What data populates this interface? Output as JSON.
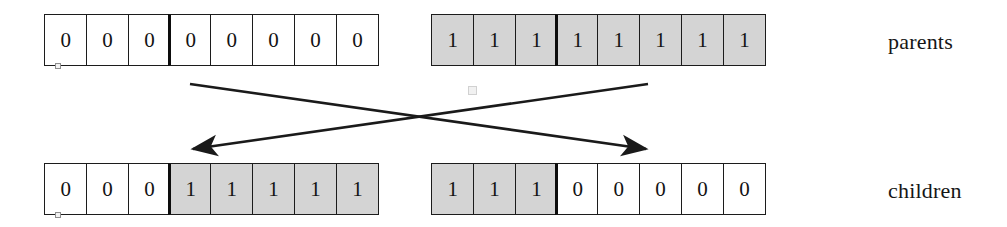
{
  "diagram": {
    "labels": {
      "parents": "parents",
      "children": "children"
    },
    "crossover_point": 3,
    "colors": {
      "shaded_cell": "#d4d4d4",
      "plain_cell": "#ffffff",
      "stroke": "#1c1c1c",
      "text": "#131313"
    },
    "rows": [
      {
        "id": "parent-1",
        "group": "parents",
        "side": "left",
        "cells": [
          {
            "value": "0",
            "shaded": false
          },
          {
            "value": "0",
            "shaded": false
          },
          {
            "value": "0",
            "shaded": false
          },
          {
            "value": "0",
            "shaded": false
          },
          {
            "value": "0",
            "shaded": false
          },
          {
            "value": "0",
            "shaded": false
          },
          {
            "value": "0",
            "shaded": false
          },
          {
            "value": "0",
            "shaded": false
          }
        ]
      },
      {
        "id": "parent-2",
        "group": "parents",
        "side": "right",
        "cells": [
          {
            "value": "1",
            "shaded": true
          },
          {
            "value": "1",
            "shaded": true
          },
          {
            "value": "1",
            "shaded": true
          },
          {
            "value": "1",
            "shaded": true
          },
          {
            "value": "1",
            "shaded": true
          },
          {
            "value": "1",
            "shaded": true
          },
          {
            "value": "1",
            "shaded": true
          },
          {
            "value": "1",
            "shaded": true
          }
        ]
      },
      {
        "id": "child-1",
        "group": "children",
        "side": "left",
        "cells": [
          {
            "value": "0",
            "shaded": false
          },
          {
            "value": "0",
            "shaded": false
          },
          {
            "value": "0",
            "shaded": false
          },
          {
            "value": "1",
            "shaded": true
          },
          {
            "value": "1",
            "shaded": true
          },
          {
            "value": "1",
            "shaded": true
          },
          {
            "value": "1",
            "shaded": true
          },
          {
            "value": "1",
            "shaded": true
          }
        ]
      },
      {
        "id": "child-2",
        "group": "children",
        "side": "right",
        "cells": [
          {
            "value": "1",
            "shaded": true
          },
          {
            "value": "1",
            "shaded": true
          },
          {
            "value": "1",
            "shaded": true
          },
          {
            "value": "0",
            "shaded": false
          },
          {
            "value": "0",
            "shaded": false
          },
          {
            "value": "0",
            "shaded": false
          },
          {
            "value": "0",
            "shaded": false
          },
          {
            "value": "0",
            "shaded": false
          }
        ]
      }
    ],
    "arrows": [
      {
        "id": "arrow-right-parent-to-left-child",
        "from": [
          648,
          84
        ],
        "to": [
          193,
          149
        ]
      },
      {
        "id": "arrow-left-parent-to-right-child",
        "from": [
          190,
          84
        ],
        "to": [
          646,
          149
        ]
      }
    ]
  }
}
